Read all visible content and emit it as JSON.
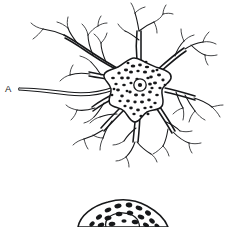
{
  "figure": {
    "background_color": "#ffffff",
    "ink_color": "#17181a",
    "width": 227,
    "height": 227
  },
  "labels": [
    {
      "id": "axon-label",
      "text": "A",
      "meaning": "axon",
      "x": 5,
      "y": 92
    }
  ],
  "structures": {
    "soma": {
      "name": "cell body",
      "center_x": 141,
      "center_y": 86,
      "radius": 26,
      "process_count": 8,
      "texture": "stippled Nissl substance"
    },
    "nucleus": {
      "name": "nucleus",
      "center_x": 140,
      "center_y": 85,
      "radius": 6.2
    },
    "nucleolus": {
      "name": "nucleolus",
      "center_x": 140,
      "center_y": 85,
      "radius": 2.1
    },
    "axon": {
      "name": "axon",
      "start_x": 19,
      "start_y": 89,
      "end_x": 124,
      "end_y": 84
    },
    "second_soma": {
      "name": "second cell body (cropped)",
      "center_x": 120,
      "center_y": 232,
      "texture": "stippled Nissl substance"
    }
  }
}
